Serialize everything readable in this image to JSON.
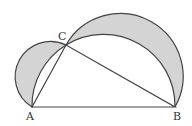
{
  "diagram": {
    "labels": {
      "A": "A",
      "B": "B",
      "C": "C"
    },
    "points": {
      "A": [
        32,
        107
      ],
      "B": [
        175,
        107
      ],
      "C": [
        66,
        45
      ]
    },
    "colors": {
      "stroke": "#444444",
      "fill": "#d4d4d4",
      "background": "#ffffff"
    }
  }
}
